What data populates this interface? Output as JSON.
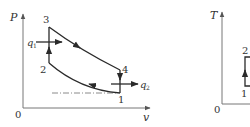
{
  "diagrams": [
    {
      "id": "pv",
      "axes": {
        "y_label": "P",
        "x_label": "v",
        "origin_label": "0"
      },
      "points": [
        {
          "label": "1",
          "x": 120,
          "y": 93
        },
        {
          "label": "2",
          "x": 49,
          "y": 63
        },
        {
          "label": "3",
          "x": 49,
          "y": 27
        },
        {
          "label": "4",
          "x": 120,
          "y": 70
        }
      ],
      "heat_in": {
        "label": "q",
        "sub": "1"
      },
      "heat_out": {
        "label": "q",
        "sub": "2"
      }
    },
    {
      "id": "ts",
      "axes": {
        "y_label": "T",
        "origin_label": "0"
      },
      "points": [
        {
          "label": "1",
          "x": 245,
          "y": 86
        },
        {
          "label": "2",
          "x": 245,
          "y": 57
        }
      ]
    }
  ],
  "colors": {
    "line": "#2a2a2a",
    "axis": "#777777",
    "text": "#333333",
    "dash": "#8a8a8a"
  }
}
